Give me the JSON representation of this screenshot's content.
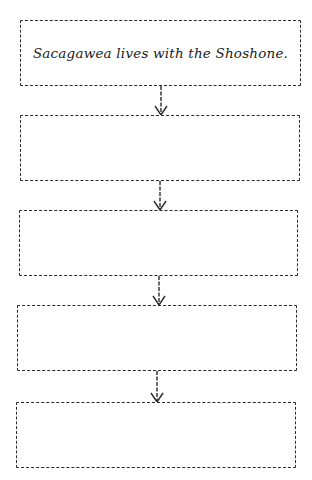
{
  "diagram": {
    "type": "flowchart-sequence",
    "boxes": [
      {
        "text": "Sacagawea lives with the Shoshone."
      },
      {
        "text": ""
      },
      {
        "text": ""
      },
      {
        "text": ""
      },
      {
        "text": ""
      }
    ],
    "connectors": [
      {
        "from": 0,
        "to": 1,
        "icon": "down-arrow-icon"
      },
      {
        "from": 1,
        "to": 2,
        "icon": "down-arrow-icon"
      },
      {
        "from": 2,
        "to": 3,
        "icon": "down-arrow-icon"
      },
      {
        "from": 3,
        "to": 4,
        "icon": "down-arrow-icon"
      }
    ],
    "colors": {
      "stroke": "#2a2a2a",
      "text": "#222222",
      "background": "#ffffff"
    }
  }
}
